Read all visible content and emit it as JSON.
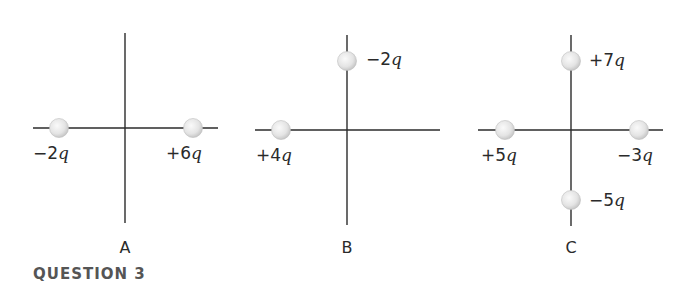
{
  "question": {
    "title": "QUESTION 3"
  },
  "colors": {
    "axis": "#2b2b2b",
    "particle_fill": "#e6e6e6",
    "particle_edge": "#bdbdbd",
    "text": "#2a2a2a",
    "title": "#555555"
  },
  "panels": [
    {
      "label": "A",
      "origin": [
        125,
        128
      ],
      "h_axis": [
        33,
        218
      ],
      "v_axis": [
        33,
        223
      ],
      "charges": [
        {
          "value": "−2",
          "unit": "q",
          "pos": [
            59,
            128
          ],
          "label_pos": [
            33,
            145
          ]
        },
        {
          "value": "+6",
          "unit": "q",
          "pos": [
            193,
            128
          ],
          "label_pos": [
            166,
            145
          ]
        }
      ]
    },
    {
      "label": "B",
      "origin": [
        347,
        130
      ],
      "h_axis": [
        255,
        440
      ],
      "v_axis": [
        35,
        225
      ],
      "charges": [
        {
          "value": "+4",
          "unit": "q",
          "pos": [
            281,
            130
          ],
          "label_pos": [
            256,
            147
          ]
        },
        {
          "value": "−2",
          "unit": "q",
          "pos": [
            347,
            61
          ],
          "label_pos": [
            366,
            51
          ]
        }
      ]
    },
    {
      "label": "C",
      "origin": [
        571,
        130
      ],
      "h_axis": [
        478,
        663
      ],
      "v_axis": [
        35,
        226
      ],
      "charges": [
        {
          "value": "+7",
          "unit": "q",
          "pos": [
            571,
            61
          ],
          "label_pos": [
            589,
            52
          ]
        },
        {
          "value": "+5",
          "unit": "q",
          "pos": [
            505,
            130
          ],
          "label_pos": [
            481,
            147
          ]
        },
        {
          "value": "−3",
          "unit": "q",
          "pos": [
            639,
            130
          ],
          "label_pos": [
            617,
            147
          ]
        },
        {
          "value": "−5",
          "unit": "q",
          "pos": [
            571,
            200
          ],
          "label_pos": [
            589,
            192
          ]
        }
      ]
    }
  ]
}
